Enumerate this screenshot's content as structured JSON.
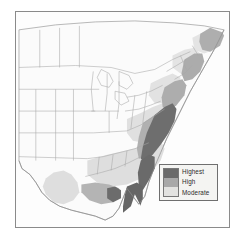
{
  "figure": {
    "type": "choropleth-map",
    "region": "Eastern United States",
    "background_color": "#ffffff",
    "frame_color": "#8a8a8a"
  },
  "map": {
    "land_fill": "#fbfbfb",
    "border_color": "#9a9a9a",
    "coast_color": "#8c8c8c",
    "shade_colors": {
      "highest": "#6a6a6a",
      "high": "#a8a8a8",
      "moderate": "#d8d8d6"
    },
    "shaded_areas": [
      {
        "name": "florida-peninsula",
        "level": "highest"
      },
      {
        "name": "southeast-atlantic-coast",
        "level": "highest"
      },
      {
        "name": "gulf-coast-louisiana",
        "level": "highest"
      },
      {
        "name": "mid-atlantic-coast",
        "level": "high"
      },
      {
        "name": "coastal-plain-carolinas",
        "level": "high"
      },
      {
        "name": "new-england-coast",
        "level": "high"
      },
      {
        "name": "maritime-canada-coast",
        "level": "high"
      },
      {
        "name": "texas-gulf-coast",
        "level": "moderate"
      },
      {
        "name": "inland-southeast",
        "level": "moderate"
      },
      {
        "name": "appalachian-piedmont",
        "level": "moderate"
      },
      {
        "name": "northeast-interior",
        "level": "moderate"
      }
    ]
  },
  "legend": {
    "position": "bottom-right",
    "items": [
      {
        "label": "Highest",
        "color": "#6a6a6a"
      },
      {
        "label": "High",
        "color": "#a8a8a8"
      },
      {
        "label": "Moderate",
        "color": "#e2e2e0"
      }
    ],
    "box_fill": "#f4f4f2",
    "box_border": "#6f6f6f"
  }
}
